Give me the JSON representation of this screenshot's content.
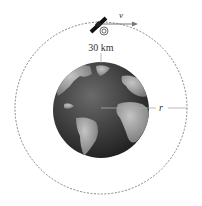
{
  "diagram": {
    "labels": {
      "velocity": "v",
      "altitude": "30 km",
      "radius": "r"
    },
    "colors": {
      "orbit": "#555555",
      "ocean": "#3a3a3a",
      "land": "#9a9a9a",
      "line": "#888888",
      "satellite": "#111111"
    }
  }
}
